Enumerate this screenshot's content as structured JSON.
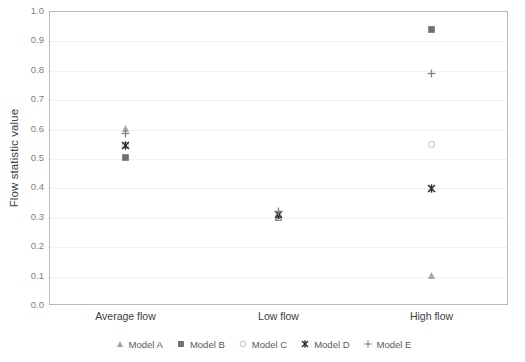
{
  "chart_data": {
    "type": "scatter",
    "title": "",
    "xlabel": "",
    "ylabel": "Flow statistic value",
    "categories": [
      "Average flow",
      "Low flow",
      "High flow"
    ],
    "ylim": [
      0.0,
      1.0
    ],
    "ytick_labels": [
      "0.0",
      "0.1",
      "0.2",
      "0.3",
      "0.4",
      "0.5",
      "0.6",
      "0.7",
      "0.8",
      "0.9",
      "1.0"
    ],
    "ytick_values": [
      0.0,
      0.1,
      0.2,
      0.3,
      0.4,
      0.5,
      0.6,
      0.7,
      0.8,
      0.9,
      1.0
    ],
    "grid": true,
    "legend_position": "bottom",
    "series": [
      {
        "name": "Model A",
        "marker": "triangle",
        "color": "#a6a6a6",
        "values": [
          0.6,
          0.305,
          0.1
        ]
      },
      {
        "name": "Model B",
        "marker": "square",
        "color": "#707070",
        "values": [
          0.5,
          0.295,
          0.935
        ]
      },
      {
        "name": "Model C",
        "marker": "circle-open",
        "color": "#d0d0d0",
        "values": [
          0.54,
          0.3,
          0.545
        ]
      },
      {
        "name": "Model D",
        "marker": "x-star",
        "color": "#2b2b2b",
        "values": [
          0.54,
          0.305,
          0.395
        ]
      },
      {
        "name": "Model E",
        "marker": "plus",
        "color": "#808080",
        "values": [
          0.58,
          0.315,
          0.785
        ]
      }
    ]
  },
  "axis": {
    "y_title": "Flow statistic value"
  },
  "legend": {
    "items": [
      {
        "label": "Model A"
      },
      {
        "label": "Model B"
      },
      {
        "label": "Model C"
      },
      {
        "label": "Model D"
      },
      {
        "label": "Model E"
      }
    ]
  }
}
